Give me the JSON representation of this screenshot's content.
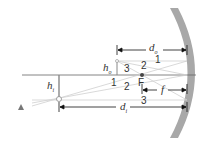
{
  "diagram": {
    "labels": {
      "d_o": "d",
      "d_o_sub": "o",
      "d_i": "d",
      "d_i_sub": "i",
      "h_o": "h",
      "h_o_sub": "o",
      "h_i": "h",
      "h_i_sub": "i",
      "focal_point": "F",
      "focal_length": "f",
      "ray_1a": "1",
      "ray_2a": "2",
      "ray_3a": "3",
      "ray_1b": "1",
      "ray_2b": "2",
      "ray_3b": "3"
    },
    "colors": {
      "mirror": "#9a9a9a",
      "axis": "#555555",
      "rays": "#c8c8c8",
      "dimension": "#111111"
    }
  }
}
